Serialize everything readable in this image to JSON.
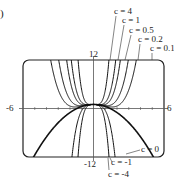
{
  "panel_label": ")",
  "chart_data": {
    "type": "line",
    "title": "",
    "function_family": "f(x) = c x^4 - x^2/2 + 1",
    "xlim": [
      -6,
      6
    ],
    "ylim": [
      -12,
      12
    ],
    "axis_labels": {
      "x_min": "-6",
      "x_max": "6",
      "y_max": "12",
      "y_min": "-12"
    },
    "grid": false,
    "series": [
      {
        "name": "c = 4",
        "c": 4
      },
      {
        "name": "c = 1",
        "c": 1
      },
      {
        "name": "c = 0.5",
        "c": 0.5
      },
      {
        "name": "c = 0.2",
        "c": 0.2
      },
      {
        "name": "c = 0.1",
        "c": 0.1
      },
      {
        "name": "c = 0",
        "c": 0
      },
      {
        "name": "c = -1",
        "c": -1
      },
      {
        "name": "c = -4",
        "c": -4
      }
    ],
    "annotations": [
      {
        "text": "c = 4",
        "x": 114,
        "y": 7
      },
      {
        "text": "c = 1",
        "x": 122,
        "y": 16
      },
      {
        "text": "c = 0.5",
        "x": 129,
        "y": 26
      },
      {
        "text": "c = 0.2",
        "x": 138,
        "y": 35
      },
      {
        "text": "c = 0.1",
        "x": 150,
        "y": 44
      },
      {
        "text": "c = 0",
        "x": 141,
        "y": 145
      },
      {
        "text": "c = -1",
        "x": 111,
        "y": 158
      },
      {
        "text": "c = -4",
        "x": 108,
        "y": 170
      }
    ]
  }
}
